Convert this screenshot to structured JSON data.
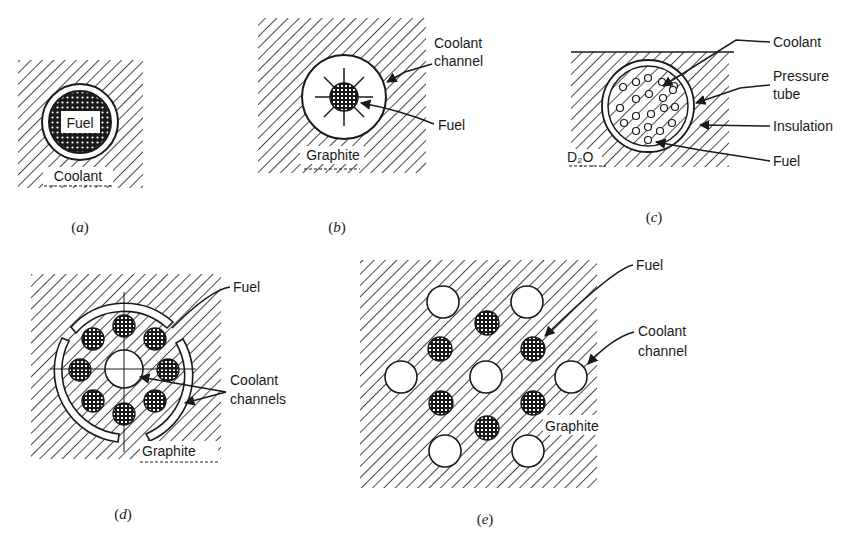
{
  "figure": {
    "panels": [
      {
        "id": "a",
        "caption": "a",
        "labels": {
          "fuel": "Fuel",
          "coolant": "Coolant"
        }
      },
      {
        "id": "b",
        "caption": "b",
        "labels": {
          "coolant_channel_1": "Coolant",
          "coolant_channel_2": "channel",
          "fuel": "Fuel",
          "graphite": "Graphite"
        }
      },
      {
        "id": "c",
        "caption": "c",
        "labels": {
          "coolant": "Coolant",
          "pressure_tube_1": "Pressure",
          "pressure_tube_2": "tube",
          "insulation": "Insulation",
          "fuel": "Fuel",
          "moderator": "D₂O"
        }
      },
      {
        "id": "d",
        "caption": "d",
        "labels": {
          "fuel": "Fuel",
          "coolant_channels_1": "Coolant",
          "coolant_channels_2": "channels",
          "graphite": "Graphite"
        }
      },
      {
        "id": "e",
        "caption": "e",
        "labels": {
          "fuel": "Fuel",
          "coolant_channel_1": "Coolant",
          "coolant_channel_2": "channel",
          "graphite": "Graphite"
        }
      }
    ],
    "colors": {
      "ink": "#1a1a1a",
      "background": "#ffffff"
    }
  }
}
